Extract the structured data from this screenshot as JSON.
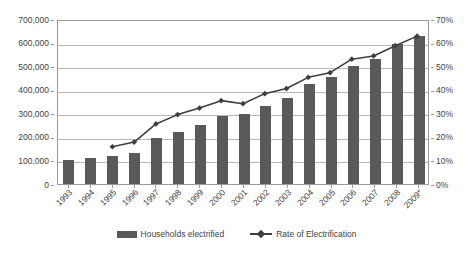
{
  "chart_data": {
    "type": "bar",
    "title": "",
    "subtitle": "",
    "xlabel": "",
    "ylabel": "",
    "grid": true,
    "legend_position": "bottom",
    "categories": [
      "1993",
      "1994",
      "1995",
      "1996",
      "1997",
      "1998",
      "1999",
      "2000",
      "2001",
      "2002",
      "2003",
      "2004",
      "2005",
      "2006",
      "2007",
      "2008",
      "2009*"
    ],
    "axes": {
      "left": {
        "label": "",
        "ticks": [
          "0",
          "100,000",
          "200,000",
          "300,000",
          "400,000",
          "500,000",
          "600,000",
          "700,000"
        ],
        "tick_values": [
          0,
          100000,
          200000,
          300000,
          400000,
          500000,
          600000,
          700000
        ],
        "min": 0,
        "max": 700000
      },
      "right": {
        "label": "",
        "ticks": [
          "0%",
          "10%",
          "20%",
          "30%",
          "40%",
          "50%",
          "60%",
          "70%"
        ],
        "tick_values": [
          0,
          10,
          20,
          30,
          40,
          50,
          60,
          70
        ],
        "min": 0,
        "max": 70
      }
    },
    "series": [
      {
        "name": "Households electrified",
        "type": "bar",
        "axis": "left",
        "color": "#595959",
        "values": [
          101000,
          109000,
          118000,
          133000,
          194000,
          222000,
          251000,
          289000,
          299000,
          333000,
          364000,
          424000,
          454000,
          499000,
          532000,
          592000,
          627000
        ]
      },
      {
        "name": "Rate of Electrification",
        "type": "line",
        "axis": "right",
        "color": "#3f3f3f",
        "values": [
          null,
          null,
          16.0,
          18.0,
          25.8,
          29.8,
          32.6,
          35.8,
          34.5,
          38.8,
          41.0,
          45.8,
          47.8,
          53.6,
          55.0,
          59.4,
          63.5
        ]
      }
    ]
  },
  "legend": {
    "items": [
      {
        "label": "Households electrified",
        "marker": "bar-swatch"
      },
      {
        "label": "Rate of Electrification",
        "marker": "line-diamond-marker"
      }
    ]
  }
}
